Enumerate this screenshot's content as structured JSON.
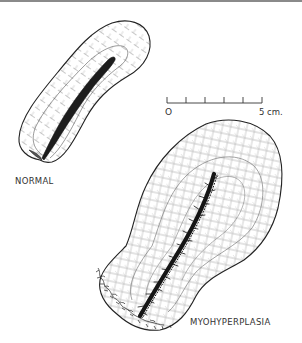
{
  "figure": {
    "type": "anatomical-line-illustration",
    "ink_color": "#222222",
    "hatch_color": "#9a9a9a",
    "background_color": "#ffffff",
    "top_rule_color": "#8a8a8a"
  },
  "specimens": [
    {
      "id": "normal",
      "label": "NORMAL"
    },
    {
      "id": "myohyperplasia",
      "label": "MYOHYPERPLASIA"
    }
  ],
  "scale_bar": {
    "start_label": "O",
    "end_label": "5 cm.",
    "divisions": 5
  }
}
